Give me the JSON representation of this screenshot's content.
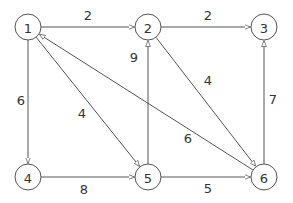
{
  "diagram": {
    "type": "directed-weighted-graph",
    "nodes": [
      {
        "id": "1",
        "label": "1",
        "x": 28,
        "y": 27
      },
      {
        "id": "2",
        "label": "2",
        "x": 148,
        "y": 27
      },
      {
        "id": "3",
        "label": "3",
        "x": 264,
        "y": 27
      },
      {
        "id": "4",
        "label": "4",
        "x": 28,
        "y": 177
      },
      {
        "id": "5",
        "label": "5",
        "x": 148,
        "y": 177
      },
      {
        "id": "6",
        "label": "6",
        "x": 264,
        "y": 177
      }
    ],
    "edges": [
      {
        "from": "1",
        "to": "2",
        "weight": "2",
        "lx": 88,
        "ly": 15
      },
      {
        "from": "2",
        "to": "3",
        "weight": "2",
        "lx": 208,
        "ly": 15
      },
      {
        "from": "1",
        "to": "4",
        "weight": "6",
        "lx": 21,
        "ly": 100
      },
      {
        "from": "1",
        "to": "5",
        "weight": "4",
        "lx": 82,
        "ly": 113
      },
      {
        "from": "5",
        "to": "2",
        "weight": "9",
        "lx": 134,
        "ly": 57
      },
      {
        "from": "2",
        "to": "6",
        "weight": "4",
        "lx": 208,
        "ly": 80
      },
      {
        "from": "6",
        "to": "1",
        "weight": "6",
        "lx": 188,
        "ly": 138
      },
      {
        "from": "6",
        "to": "3",
        "weight": "7",
        "lx": 273,
        "ly": 99
      },
      {
        "from": "4",
        "to": "5",
        "weight": "8",
        "lx": 84,
        "ly": 189
      },
      {
        "from": "5",
        "to": "6",
        "weight": "5",
        "lx": 208,
        "ly": 188
      }
    ],
    "node_radius": 13,
    "colors": {
      "stroke": "#555555",
      "text": "#333333",
      "background": "#ffffff"
    }
  }
}
